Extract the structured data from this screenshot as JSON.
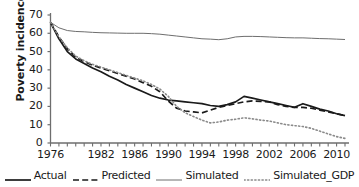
{
  "chart_data": {
    "type": "line",
    "title": "",
    "xlabel": "",
    "ylabel": "Poverty incidence (%)",
    "ylim": [
      0,
      70
    ],
    "ytick_labels": [
      "70",
      "60",
      "50",
      "40",
      "30",
      "20",
      "10",
      "0"
    ],
    "ytick_values": [
      70,
      60,
      50,
      40,
      30,
      20,
      10,
      0
    ],
    "xlim": [
      1976,
      2011
    ],
    "xtick_labels": [
      "1976",
      "1982",
      "1986",
      "1990",
      "1994",
      "1998",
      "2002",
      "2006",
      "2010"
    ],
    "xtick_values": [
      1976,
      1982,
      1986,
      1990,
      1994,
      1998,
      2002,
      2006,
      2010
    ],
    "grid": false,
    "legend_position": "bottom",
    "x": [
      1976,
      1977,
      1978,
      1979,
      1980,
      1981,
      1982,
      1983,
      1984,
      1985,
      1986,
      1987,
      1988,
      1989,
      1990,
      1991,
      1992,
      1993,
      1994,
      1995,
      1996,
      1997,
      1998,
      1999,
      2000,
      2001,
      2002,
      2003,
      2004,
      2005,
      2006,
      2007,
      2008,
      2009,
      2010,
      2011
    ],
    "series": [
      {
        "name": "Actual",
        "style": "solid",
        "color": "#1a1a1a",
        "width": 1.7,
        "values": [
          66.0,
          57.0,
          50.0,
          46.0,
          43.5,
          41.0,
          39.0,
          36.5,
          34.5,
          32.0,
          30.0,
          28.0,
          26.0,
          24.5,
          23.5,
          23.0,
          22.5,
          22.0,
          21.5,
          20.5,
          20.0,
          21.0,
          22.5,
          25.5,
          24.5,
          23.5,
          22.5,
          21.5,
          20.5,
          19.5,
          21.5,
          20.0,
          18.5,
          17.5,
          16.0,
          15.0
        ]
      },
      {
        "name": "Predicted",
        "style": "dashed",
        "color": "#1a1a1a",
        "width": 1.7,
        "values": [
          66.0,
          58.0,
          51.5,
          47.0,
          44.5,
          42.5,
          41.0,
          39.5,
          38.0,
          36.5,
          35.0,
          33.0,
          31.0,
          28.0,
          23.0,
          19.0,
          17.5,
          17.0,
          16.5,
          18.0,
          19.5,
          20.5,
          21.5,
          22.5,
          23.0,
          22.8,
          22.5,
          21.0,
          20.0,
          19.5,
          19.5,
          19.0,
          18.0,
          17.0,
          16.0,
          15.0
        ]
      },
      {
        "name": "Simulated",
        "style": "solid-thin",
        "color": "#6e6e6e",
        "width": 1.0,
        "values": [
          66.0,
          63.0,
          61.5,
          61.0,
          60.8,
          60.5,
          60.3,
          60.2,
          60.1,
          60.0,
          60.0,
          60.0,
          59.8,
          59.5,
          59.0,
          58.5,
          58.0,
          57.5,
          57.0,
          56.8,
          56.5,
          57.0,
          58.0,
          58.3,
          58.3,
          58.2,
          58.0,
          57.8,
          57.6,
          57.5,
          57.5,
          57.3,
          57.1,
          57.0,
          56.8,
          56.6
        ]
      },
      {
        "name": "Simulated_GDP",
        "style": "dotted",
        "color": "#8a8a8a",
        "width": 1.6,
        "values": [
          66.0,
          58.0,
          52.0,
          47.5,
          45.0,
          43.0,
          41.5,
          40.0,
          38.5,
          37.0,
          35.5,
          34.0,
          32.0,
          29.5,
          25.5,
          20.0,
          16.5,
          14.5,
          12.5,
          11.0,
          11.5,
          12.5,
          13.0,
          13.8,
          13.2,
          12.5,
          12.0,
          11.0,
          10.0,
          9.5,
          9.0,
          8.0,
          6.5,
          5.0,
          3.5,
          2.5
        ]
      }
    ]
  },
  "legend": {
    "items": [
      {
        "label": "Actual",
        "swatch": "solid-thick-swatch"
      },
      {
        "label": "Predicted",
        "swatch": "dashed-swatch"
      },
      {
        "label": "Simulated",
        "swatch": "solid-thin-swatch"
      },
      {
        "label": "Simulated_GDP",
        "swatch": "dotted-swatch"
      }
    ]
  }
}
